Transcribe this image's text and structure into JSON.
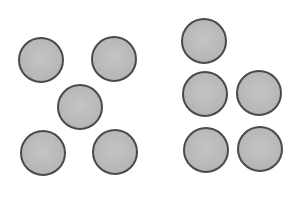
{
  "diagram": {
    "colors": {
      "fill": "#b9b9b9",
      "stroke": "#4a4a4a",
      "background": "#ffffff"
    },
    "groups": [
      {
        "name": "left-group",
        "arrangement": "quincunx (dice five)",
        "count": 5,
        "circles": [
          {
            "cx": 41,
            "cy": 60,
            "r": 23
          },
          {
            "cx": 114,
            "cy": 59,
            "r": 23
          },
          {
            "cx": 80,
            "cy": 107,
            "r": 23
          },
          {
            "cx": 43,
            "cy": 153,
            "r": 23
          },
          {
            "cx": 115,
            "cy": 152,
            "r": 23
          }
        ]
      },
      {
        "name": "right-group",
        "arrangement": "one on top, then two rows of two",
        "count": 5,
        "circles": [
          {
            "cx": 204,
            "cy": 41,
            "r": 23
          },
          {
            "cx": 205,
            "cy": 94,
            "r": 23
          },
          {
            "cx": 259,
            "cy": 93,
            "r": 23
          },
          {
            "cx": 206,
            "cy": 150,
            "r": 23
          },
          {
            "cx": 260,
            "cy": 149,
            "r": 23
          }
        ]
      }
    ]
  }
}
